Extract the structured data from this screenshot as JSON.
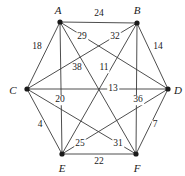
{
  "figure": {
    "name": "weighted-complete-graph-k6",
    "width": 185,
    "height": 176,
    "background_color": "#ffffff",
    "line_color": "#3a3a3a",
    "vertex_color": "#1a1a1a",
    "text_color": "#1a1a1a"
  },
  "chart_data": {
    "type": "diagram",
    "title": "",
    "graph_type": "complete weighted graph K6",
    "vertex_count": 6,
    "edge_count": 15,
    "vertices": [
      {
        "id": "A",
        "label": "A",
        "x": 60,
        "y": 22,
        "label_x": 58,
        "label_y": 10
      },
      {
        "id": "B",
        "label": "B",
        "x": 137,
        "y": 23,
        "label_x": 137,
        "label_y": 10
      },
      {
        "id": "C",
        "label": "C",
        "x": 27,
        "y": 89,
        "label_x": 13,
        "label_y": 90
      },
      {
        "id": "D",
        "label": "D",
        "x": 168,
        "y": 89,
        "label_x": 178,
        "label_y": 90
      },
      {
        "id": "E",
        "label": "E",
        "x": 62,
        "y": 154,
        "label_x": 62,
        "label_y": 168
      },
      {
        "id": "F",
        "label": "F",
        "x": 136,
        "y": 154,
        "label_x": 137,
        "label_y": 168
      }
    ],
    "edges": [
      {
        "from": "A",
        "to": "B",
        "weight": 24,
        "label_x": 99,
        "label_y": 14
      },
      {
        "from": "A",
        "to": "C",
        "weight": 18,
        "label_x": 37,
        "label_y": 47
      },
      {
        "from": "A",
        "to": "D",
        "weight": 29,
        "label_x": 82,
        "label_y": 37
      },
      {
        "from": "A",
        "to": "E",
        "weight": 20,
        "label_x": 60,
        "label_y": 100
      },
      {
        "from": "A",
        "to": "F",
        "weight": 38,
        "label_x": 77,
        "label_y": 68
      },
      {
        "from": "B",
        "to": "C",
        "weight": 32,
        "label_x": 115,
        "label_y": 37
      },
      {
        "from": "B",
        "to": "D",
        "weight": 14,
        "label_x": 158,
        "label_y": 47
      },
      {
        "from": "B",
        "to": "E",
        "weight": 11,
        "label_x": 104,
        "label_y": 68
      },
      {
        "from": "B",
        "to": "F",
        "weight": 36,
        "label_x": 138,
        "label_y": 100
      },
      {
        "from": "C",
        "to": "D",
        "weight": 13,
        "label_x": 113,
        "label_y": 89
      },
      {
        "from": "C",
        "to": "E",
        "weight": 4,
        "label_x": 40,
        "label_y": 125
      },
      {
        "from": "C",
        "to": "F",
        "weight": 31,
        "label_x": 118,
        "label_y": 144
      },
      {
        "from": "D",
        "to": "E",
        "weight": 25,
        "label_x": 80,
        "label_y": 144
      },
      {
        "from": "D",
        "to": "F",
        "weight": 7,
        "label_x": 155,
        "label_y": 125
      },
      {
        "from": "E",
        "to": "F",
        "weight": 22,
        "label_x": 99,
        "label_y": 162
      }
    ]
  }
}
